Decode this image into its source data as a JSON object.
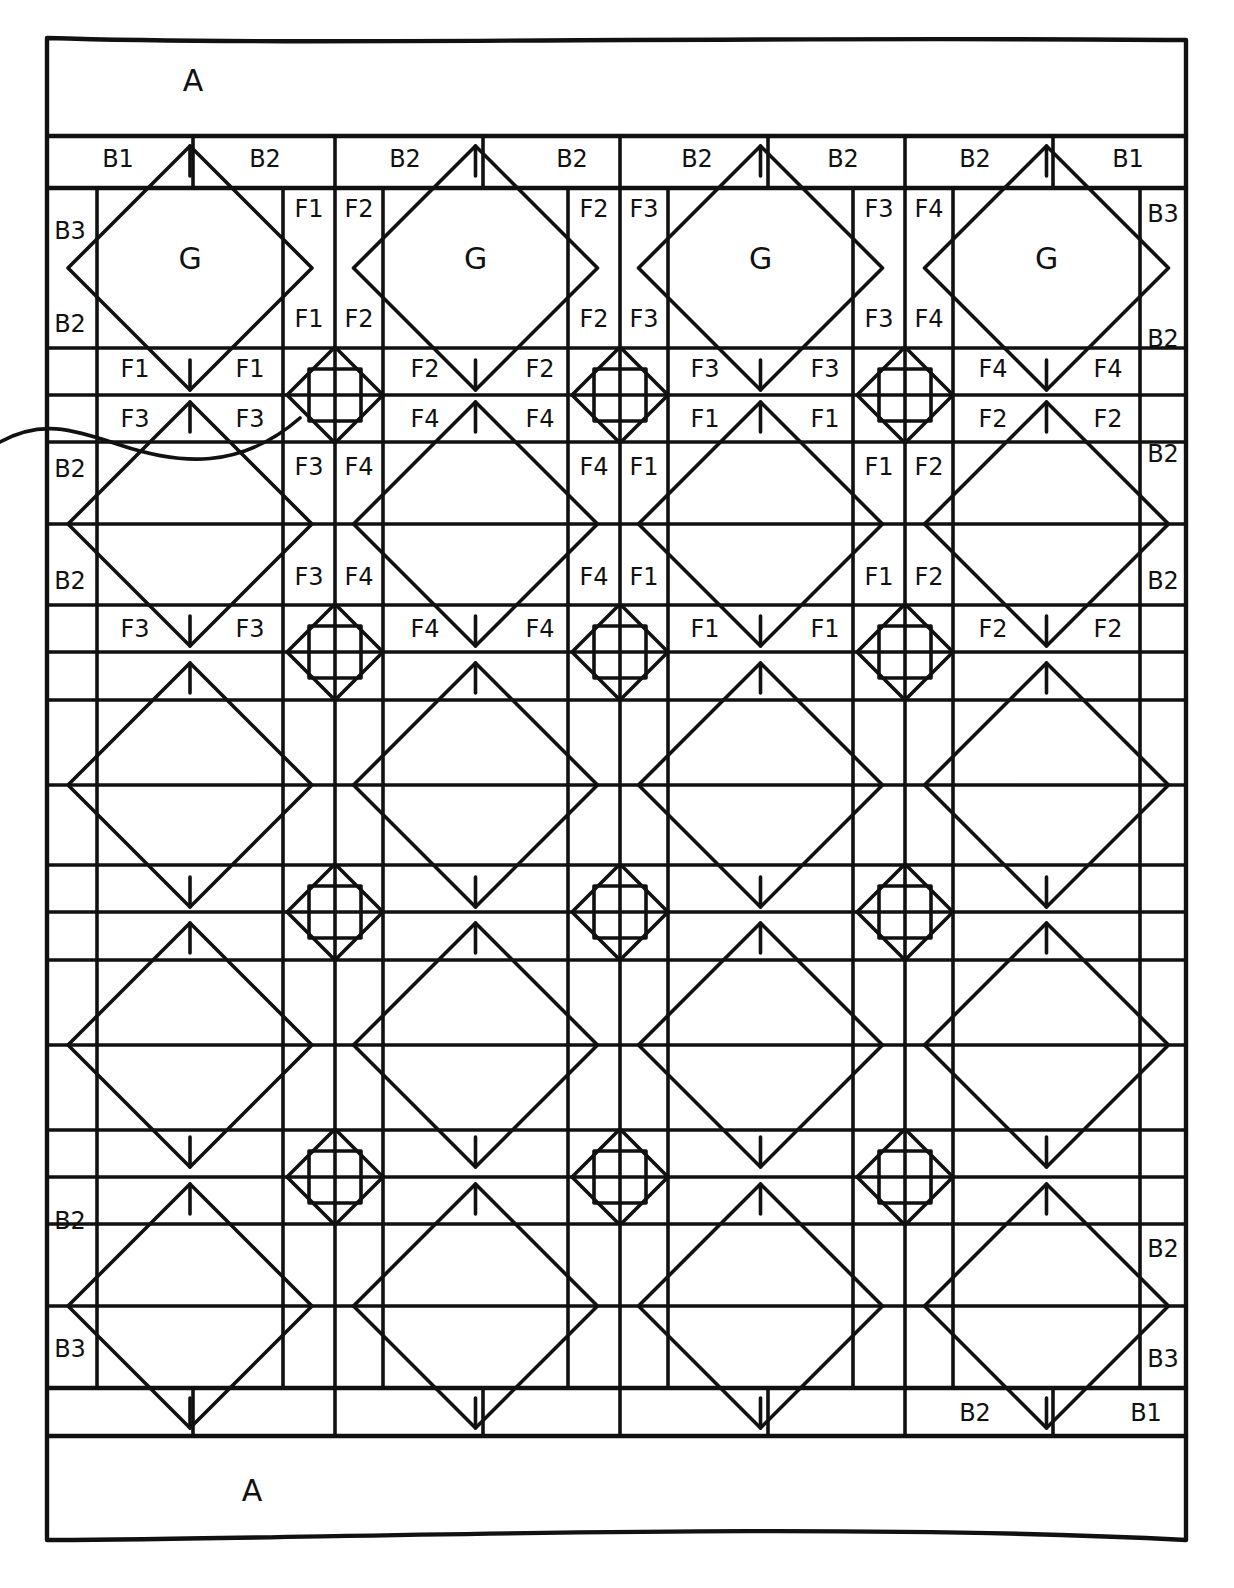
{
  "diagram": {
    "type": "quilt-layout",
    "ink_color": "#111111",
    "paper_color": "#ffffff",
    "outer_border": {
      "top_label": "A",
      "bottom_label": "A"
    },
    "inner_border": {
      "top": [
        "B1",
        "B2",
        "B2",
        "B2",
        "B2",
        "B2",
        "B2",
        "B1"
      ],
      "bottom": [
        "B2",
        "B1"
      ],
      "left": [
        "B3",
        "B2",
        "B2",
        "B2",
        "B2",
        "B3"
      ],
      "right": [
        "B3",
        "B2",
        "B2",
        "B2",
        "B2",
        "B3"
      ]
    },
    "grid": {
      "block_columns": 4,
      "block_rows": 4
    },
    "block_center_labels": [
      "G",
      "G",
      "G",
      "G"
    ],
    "vertical_sashing_rows": [
      {
        "row": 1,
        "upper": [
          [
            "F1",
            "F2"
          ],
          [
            "F2",
            "F3"
          ],
          [
            "F3",
            "F4"
          ]
        ],
        "lower": [
          [
            "F1",
            "F2"
          ],
          [
            "F2",
            "F3"
          ],
          [
            "F3",
            "F4"
          ]
        ]
      },
      {
        "row": 2,
        "upper": [
          [
            "F3",
            "F4"
          ],
          [
            "F4",
            "F1"
          ],
          [
            "F1",
            "F2"
          ]
        ],
        "lower": [
          [
            "F3",
            "F4"
          ],
          [
            "F4",
            "F1"
          ],
          [
            "F1",
            "F2"
          ]
        ]
      }
    ],
    "horizontal_sashing_rows": [
      {
        "after_row": 1,
        "top": [
          "F1",
          "F1",
          "F2",
          "F2",
          "F3",
          "F3",
          "F4",
          "F4"
        ],
        "bottom": [
          "F3",
          "F3",
          "F4",
          "F4",
          "F1",
          "F1",
          "F2",
          "F2"
        ]
      },
      {
        "after_row": 2,
        "top": [
          "F3",
          "F3",
          "F4",
          "F4",
          "F1",
          "F1",
          "F2",
          "F2"
        ]
      }
    ]
  }
}
